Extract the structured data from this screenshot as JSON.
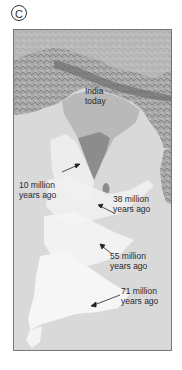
{
  "panel_label": "C",
  "figure": {
    "type": "map-diagram",
    "labels": [
      {
        "id": "india-today",
        "lines": [
          "India",
          "today"
        ]
      },
      {
        "id": "10-mya",
        "lines": [
          "10 million",
          "years ago"
        ]
      },
      {
        "id": "38-mya",
        "lines": [
          "38 million",
          "years ago"
        ]
      },
      {
        "id": "55-mya",
        "lines": [
          "55 million",
          "years ago"
        ]
      },
      {
        "id": "71-mya",
        "lines": [
          "71 million",
          "years ago"
        ]
      }
    ]
  },
  "colors": {
    "relief_dark": "#8a8a8a",
    "relief_mid": "#b5b5b5",
    "ocean": "#d8d8d8",
    "past_positions": "#f4f4f4",
    "frame": "#777777"
  }
}
